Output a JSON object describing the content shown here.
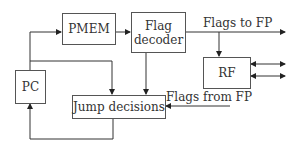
{
  "diagram": {
    "blocks": {
      "pmem": "PMEM",
      "flag_decoder_line1": "Flag",
      "flag_decoder_line2": "decoder",
      "rf": "RF",
      "pc": "PC",
      "jump": "Jump decisions"
    },
    "labels": {
      "flags_to_fp": "Flags to FP",
      "flags_from_fp": "Flags from FP"
    },
    "colors": {
      "line": "#333333",
      "border": "#555555"
    }
  }
}
